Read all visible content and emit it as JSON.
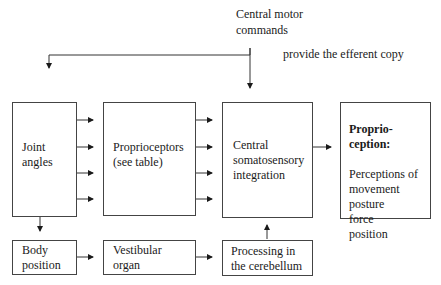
{
  "diagram": {
    "top_label": {
      "motor_commands": "Central motor\ncommands",
      "efferent_copy": "provide the efferent copy"
    },
    "boxes": {
      "joint_angles": "Joint\nangles",
      "proprioceptors": "Proprioceptors\n(see table)",
      "central_integration": "Central\nsomatosensory\nintegration",
      "proprioception_title": "Proprio-\nception:",
      "proprioception_body": "Perceptions of\nmovement\nposture\nforce\nposition",
      "body_position": "Body\nposition",
      "vestibular_organ": "Vestibular\norgan",
      "cerebellum": "Processing in\nthe cerebellum"
    },
    "connections": [
      {
        "from": "central_motor_commands",
        "to": "joint_angles"
      },
      {
        "from": "central_motor_commands",
        "to": "central_integration"
      },
      {
        "from": "joint_angles",
        "to": "proprioceptors",
        "count": 4
      },
      {
        "from": "proprioceptors",
        "to": "central_integration",
        "count": 4
      },
      {
        "from": "central_integration",
        "to": "proprioception"
      },
      {
        "from": "joint_angles",
        "to": "body_position"
      },
      {
        "from": "body_position",
        "to": "vestibular_organ"
      },
      {
        "from": "vestibular_organ",
        "to": "cerebellum"
      },
      {
        "from": "cerebellum",
        "to": "central_integration"
      }
    ]
  }
}
